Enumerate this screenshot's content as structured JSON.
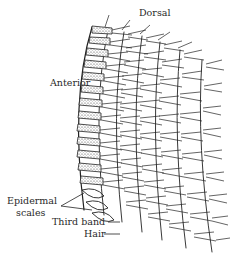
{
  "figure": {
    "type": "anatomical line drawing",
    "colors": {
      "ink": "#222222",
      "background": "#ffffff",
      "stipple": "#555555"
    }
  },
  "labels": {
    "dorsal": "Dorsal",
    "anterior": "Anterior",
    "epidermal_line1": "Epidermal",
    "epidermal_line2": "scales",
    "third_band": "Third band",
    "hair": "Hair"
  }
}
